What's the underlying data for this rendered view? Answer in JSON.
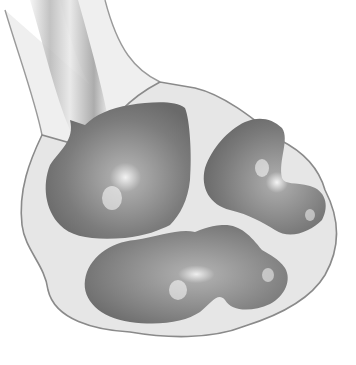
{
  "figure": {
    "style": "grayscale shaded medical illustration",
    "colors": {
      "background": "#ffffff",
      "capsule_fill": "#e6e6e6",
      "capsule_outline": "#8a8a8a",
      "cavity_dark": "#6e6e6e",
      "cavity_mid": "#9a9a9a",
      "highlight": "#f4f4f4",
      "ureter_wall": "#efefef"
    },
    "parts": [
      {
        "id": "ureter",
        "label": "Ureter"
      },
      {
        "id": "renal-pelvis",
        "label": "Renal pelvis"
      },
      {
        "id": "upper-calyx",
        "label": "Upper calyx"
      },
      {
        "id": "lower-calyx",
        "label": "Lower calyx"
      },
      {
        "id": "minor-calyx-right",
        "label": "Minor calyx"
      },
      {
        "id": "capsule",
        "label": "Capsule"
      }
    ]
  }
}
